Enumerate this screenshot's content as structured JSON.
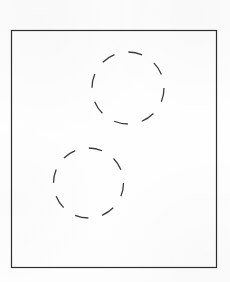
{
  "figure": {
    "title": "",
    "canvas": {
      "width": 230,
      "height": 282
    },
    "background_color": "#fefefe",
    "stroke_color": "#3b3b3b",
    "frame_stroke_color": "#2e2e2e",
    "shapes": [
      {
        "name": "outer-frame-rectangle",
        "type": "rectangle",
        "x": 11.5,
        "y": 30.5,
        "width": 205,
        "height": 237,
        "stroke_width": 1.2,
        "stroke_color": "#2e2e2e",
        "fill": "none"
      },
      {
        "name": "upper-dashed-circle",
        "type": "circle",
        "cx": 128,
        "cy": 88,
        "r": 36,
        "stroke_width": 1.3,
        "stroke_color": "#3b3b3b",
        "fill": "none",
        "dash_count": 8,
        "dash_array": "14 14.3"
      },
      {
        "name": "lower-dashed-circle",
        "type": "circle",
        "cx": 88.5,
        "cy": 183,
        "r": 35,
        "stroke_width": 1.3,
        "stroke_color": "#3b3b3b",
        "fill": "none",
        "dash_count": 8,
        "dash_array": "13.6 13.9"
      }
    ]
  }
}
